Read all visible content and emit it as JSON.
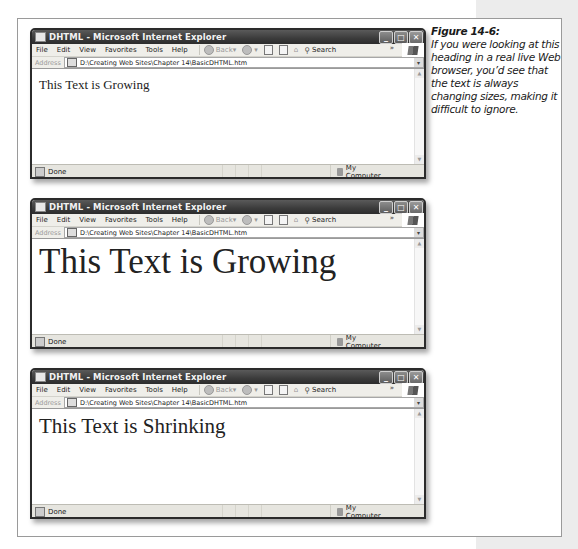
{
  "caption": {
    "figure_label": "Figure 14-6:",
    "text": "If you were looking at this heading in a real live Web browser, you’d see that the text is always changing sizes, making it difficult to ignore."
  },
  "browser": {
    "title": "DHTML - Microsoft Internet Explorer",
    "window_controls": {
      "minimize": "_",
      "maximize": "□",
      "close": "✕"
    },
    "menu": [
      "File",
      "Edit",
      "View",
      "Favorites",
      "Tools",
      "Help"
    ],
    "toolbar": {
      "back_label": "Back",
      "search_label": "Search",
      "more": "»"
    },
    "address": {
      "label": "Address",
      "value": "D:\\Creating Web Sites\\Chapter 14\\BasicDHTML.htm"
    },
    "status": {
      "left": "Done",
      "zone": "My Computer"
    }
  },
  "windows": [
    {
      "page_text": "This Text is Growing",
      "font_size_px": 13
    },
    {
      "page_text": "This Text is Growing",
      "font_size_px": 34
    },
    {
      "page_text": "This Text is Shrinking",
      "font_size_px": 20
    }
  ]
}
